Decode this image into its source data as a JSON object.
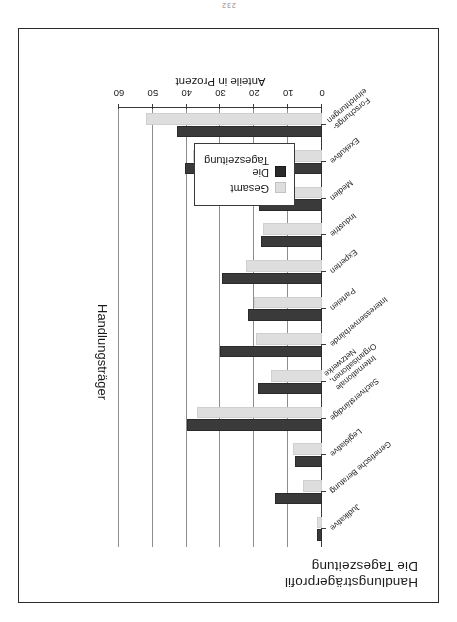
{
  "page": {
    "number": "232"
  },
  "chart_data": {
    "type": "bar",
    "orientation": "horizontal",
    "title": "Handlungsträgerprofil\nDie Tageszeitung",
    "xlabel": "Anteile in Prozent",
    "ylabel": "Handlungsträger",
    "xlim": [
      0,
      60
    ],
    "xticks": [
      0,
      10,
      20,
      30,
      40,
      50,
      60
    ],
    "xticklabels": [
      "0",
      "10",
      "20",
      "30",
      "40",
      "50",
      "60"
    ],
    "grid": true,
    "legend_position": "inside-upper-right",
    "categories": [
      "Forschungs-\neinrichtungen",
      "Exekutive",
      "Medien",
      "Industrie",
      "Experten",
      "Parteien",
      "Interessenverbände",
      "Internationale\nOrganisationen,\nNetzwerke",
      "Sachverständige",
      "Legislative",
      "Genetische Beratung",
      "Judikative"
    ],
    "series": [
      {
        "name": "Gesamt",
        "color": "#dedede",
        "values": [
          52.0,
          38.0,
          24.5,
          17.5,
          22.5,
          20.0,
          19.5,
          15.0,
          37.0,
          8.5,
          5.5,
          1.5
        ]
      },
      {
        "name": "Die Tageszeitung",
        "color": "#3a3a3a",
        "values": [
          43.0,
          40.5,
          18.5,
          18.0,
          29.5,
          22.0,
          30.0,
          19.0,
          40.0,
          8.0,
          14.0,
          1.5
        ]
      }
    ]
  },
  "legend": {
    "items": [
      {
        "label": "Gesamt",
        "swatch": "total"
      },
      {
        "label": "Die\nTageszeitung",
        "swatch": "paper"
      }
    ]
  }
}
